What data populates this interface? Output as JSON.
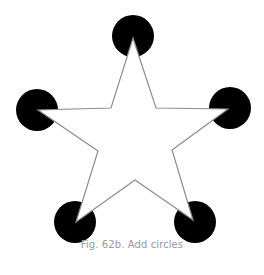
{
  "figure": {
    "caption": "Fig. 62b. Add circles",
    "circle_color": "#000000",
    "star_stroke": "#8c8c8c",
    "star_fill": "#ffffff",
    "circle_radius": 21,
    "circles": [
      {
        "name": "top",
        "cx": 133,
        "cy": 36
      },
      {
        "name": "left",
        "cx": 37,
        "cy": 110
      },
      {
        "name": "right",
        "cx": 230,
        "cy": 108
      },
      {
        "name": "bottom-left",
        "cx": 75,
        "cy": 222
      },
      {
        "name": "bottom-right",
        "cx": 195,
        "cy": 222
      }
    ],
    "star_points": "133,38 156,108 228,109 172,150 193,220 135,180 76,222 98,151 38,110 111,108"
  }
}
